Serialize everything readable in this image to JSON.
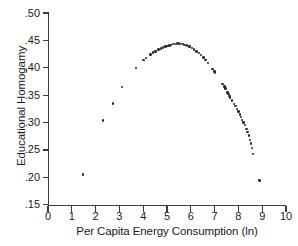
{
  "chart_data": {
    "type": "scatter",
    "title": "",
    "xlabel": "Per Capita Energy Consumption (ln)",
    "ylabel": "Educational Homogamy",
    "xlim": [
      0,
      10
    ],
    "ylim": [
      0.15,
      0.5
    ],
    "xticks": [
      0,
      1,
      2,
      3,
      4,
      5,
      6,
      7,
      8,
      9,
      10
    ],
    "xtick_labels": [
      "0",
      "1",
      "2",
      "3",
      "4",
      "5",
      "6",
      "7",
      "8",
      "9",
      "10"
    ],
    "yticks": [
      0.15,
      0.2,
      0.25,
      0.3,
      0.35,
      0.4,
      0.45,
      0.5
    ],
    "ytick_labels": [
      ".15",
      ".20",
      ".25",
      ".30",
      ".35",
      ".40",
      ".45",
      ".50"
    ],
    "grid": false,
    "legend": null,
    "marker": "filled-circle",
    "marker_color": "#2b2b2b",
    "points": [
      {
        "x": 1.48,
        "y": 0.205
      },
      {
        "x": 2.32,
        "y": 0.304
      },
      {
        "x": 2.72,
        "y": 0.335
      },
      {
        "x": 3.1,
        "y": 0.365
      },
      {
        "x": 3.7,
        "y": 0.4
      },
      {
        "x": 4.02,
        "y": 0.414
      },
      {
        "x": 4.12,
        "y": 0.418
      },
      {
        "x": 4.3,
        "y": 0.424
      },
      {
        "x": 4.4,
        "y": 0.428
      },
      {
        "x": 4.52,
        "y": 0.43
      },
      {
        "x": 4.64,
        "y": 0.433
      },
      {
        "x": 4.74,
        "y": 0.435
      },
      {
        "x": 4.84,
        "y": 0.437
      },
      {
        "x": 4.94,
        "y": 0.439
      },
      {
        "x": 5.02,
        "y": 0.44
      },
      {
        "x": 5.1,
        "y": 0.441
      },
      {
        "x": 5.18,
        "y": 0.442
      },
      {
        "x": 5.26,
        "y": 0.443
      },
      {
        "x": 5.34,
        "y": 0.443
      },
      {
        "x": 5.42,
        "y": 0.444
      },
      {
        "x": 5.5,
        "y": 0.444
      },
      {
        "x": 5.58,
        "y": 0.443
      },
      {
        "x": 5.66,
        "y": 0.443
      },
      {
        "x": 5.74,
        "y": 0.442
      },
      {
        "x": 5.84,
        "y": 0.441
      },
      {
        "x": 5.94,
        "y": 0.439
      },
      {
        "x": 6.04,
        "y": 0.436
      },
      {
        "x": 6.14,
        "y": 0.433
      },
      {
        "x": 6.24,
        "y": 0.43
      },
      {
        "x": 6.34,
        "y": 0.427
      },
      {
        "x": 6.44,
        "y": 0.423
      },
      {
        "x": 6.54,
        "y": 0.419
      },
      {
        "x": 6.62,
        "y": 0.414
      },
      {
        "x": 6.72,
        "y": 0.409
      },
      {
        "x": 6.92,
        "y": 0.398
      },
      {
        "x": 7.0,
        "y": 0.393
      },
      {
        "x": 7.02,
        "y": 0.391
      },
      {
        "x": 7.34,
        "y": 0.37
      },
      {
        "x": 7.42,
        "y": 0.366
      },
      {
        "x": 7.46,
        "y": 0.362
      },
      {
        "x": 7.54,
        "y": 0.355
      },
      {
        "x": 7.58,
        "y": 0.352
      },
      {
        "x": 7.62,
        "y": 0.349
      },
      {
        "x": 7.66,
        "y": 0.346
      },
      {
        "x": 7.74,
        "y": 0.34
      },
      {
        "x": 7.82,
        "y": 0.334
      },
      {
        "x": 7.88,
        "y": 0.33
      },
      {
        "x": 7.94,
        "y": 0.325
      },
      {
        "x": 8.0,
        "y": 0.32
      },
      {
        "x": 8.06,
        "y": 0.315
      },
      {
        "x": 8.1,
        "y": 0.31
      },
      {
        "x": 8.16,
        "y": 0.305
      },
      {
        "x": 8.22,
        "y": 0.3
      },
      {
        "x": 8.28,
        "y": 0.295
      },
      {
        "x": 8.34,
        "y": 0.288
      },
      {
        "x": 8.38,
        "y": 0.283
      },
      {
        "x": 8.44,
        "y": 0.276
      },
      {
        "x": 8.5,
        "y": 0.268
      },
      {
        "x": 8.54,
        "y": 0.262
      },
      {
        "x": 8.58,
        "y": 0.254
      },
      {
        "x": 8.62,
        "y": 0.243
      },
      {
        "x": 8.88,
        "y": 0.194
      }
    ]
  }
}
